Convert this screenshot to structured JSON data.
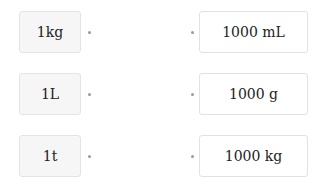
{
  "left_items": [
    {
      "label": "1kg"
    },
    {
      "label": "1L"
    },
    {
      "label": "1t"
    }
  ],
  "right_items": [
    {
      "label": "1000 mL"
    },
    {
      "label": "1000 g"
    },
    {
      "label": "1000 kg"
    }
  ],
  "colors": {
    "left_bg": "#f6f6f6",
    "right_bg": "#ffffff",
    "border": "#e2e2e2",
    "dot": "#9a9a9a"
  }
}
